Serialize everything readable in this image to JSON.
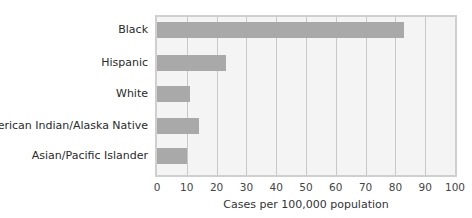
{
  "chart_data": {
    "type": "bar",
    "orientation": "horizontal",
    "title": "",
    "categories": [
      "Black",
      "Hispanic",
      "White",
      "American Indian/Alaska Native",
      "Asian/Pacific Islander"
    ],
    "values": [
      83,
      23,
      11,
      14,
      10
    ],
    "xlabel": "Cases per 100,000 population",
    "ylabel": "",
    "xlim": [
      0,
      100
    ],
    "xticks": [
      "0",
      "10",
      "20",
      "30",
      "40",
      "50",
      "60",
      "70",
      "80",
      "90",
      "100"
    ],
    "grid": true,
    "legend": null,
    "colors": {
      "bar": "#a9a9a9",
      "plot_bg": "#f4f4f4",
      "grid": "#c8c8c8"
    }
  }
}
